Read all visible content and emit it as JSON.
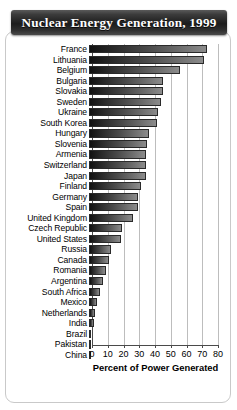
{
  "title": "Nuclear Energy Generation, 1999",
  "chart_data": {
    "type": "bar",
    "orientation": "horizontal",
    "title": "Nuclear Energy Generation, 1999",
    "xlabel": "Percent of Power Generated",
    "ylabel": "",
    "xlim": [
      0,
      80
    ],
    "xticks": [
      0,
      10,
      20,
      30,
      40,
      50,
      60,
      70,
      80
    ],
    "xtick_labels": [
      "0",
      "10",
      "20",
      "30",
      "40",
      "50",
      "60",
      "70",
      "80"
    ],
    "grid": true,
    "legend": "none",
    "categories": [
      "France",
      "Lithuania",
      "Belgium",
      "Bulgaria",
      "Slovakia",
      "Sweden",
      "Ukraine",
      "South Korea",
      "Hungary",
      "Slovenia",
      "Armenia",
      "Switzerland",
      "Japan",
      "Finland",
      "Germany",
      "Spain",
      "United Kingdom",
      "Czech Republic",
      "United States",
      "Russia",
      "Canada",
      "Romania",
      "Argentina",
      "South Africa",
      "Mexico",
      "Netherlands",
      "India",
      "Brazil",
      "Pakistan",
      "China"
    ],
    "values": [
      75,
      73,
      58,
      47,
      47,
      46,
      44,
      43,
      38,
      37,
      36,
      36,
      36,
      33,
      31,
      31,
      28,
      21,
      20,
      14,
      13,
      11,
      9,
      7,
      5,
      4,
      3,
      1,
      1,
      1
    ]
  }
}
